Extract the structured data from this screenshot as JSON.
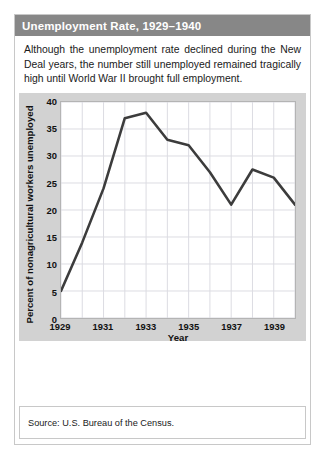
{
  "figure": {
    "title": "Unemployment Rate, 1929–1940",
    "caption": "Although the unemployment rate declined during the New Deal years, the number still unemployed remained tragically high until World War II brought full employment.",
    "source": "Source: U.S. Bureau of the Census."
  },
  "colors": {
    "header_bar": "#878787",
    "header_text": "#ffffff",
    "panel_background": "#d2d2d2",
    "plot_background": "#ffffff",
    "gridline": "#dcdce2",
    "line": "#3c3c3c",
    "text": "#111111"
  },
  "chart_data": {
    "type": "line",
    "title": "Unemployment Rate, 1929–1940",
    "xlabel": "Year",
    "ylabel": "Percent of nonagricultural workers unemployed",
    "x": [
      1929,
      1930,
      1931,
      1932,
      1933,
      1934,
      1935,
      1936,
      1937,
      1938,
      1939,
      1940
    ],
    "values": [
      5,
      14,
      24,
      37,
      38,
      33,
      32,
      27,
      21,
      27.5,
      26,
      21
    ],
    "xlim": [
      1929,
      1940
    ],
    "ylim": [
      0,
      40
    ],
    "xticks": [
      1929,
      1931,
      1933,
      1935,
      1937,
      1939
    ],
    "xtick_labels": [
      "1929",
      "1931",
      "1933",
      "1935",
      "1937",
      "1939"
    ],
    "yticks": [
      0,
      5,
      10,
      15,
      20,
      25,
      30,
      35,
      40
    ],
    "ytick_labels": [
      "0",
      "5",
      "10",
      "15",
      "20",
      "25",
      "30",
      "35",
      "40"
    ],
    "grid": true,
    "legend": false,
    "source": "Source: U.S. Bureau of the Census."
  }
}
